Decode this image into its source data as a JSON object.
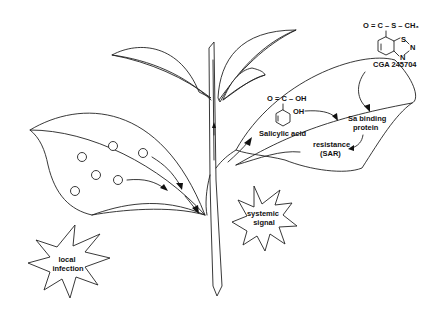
{
  "figure": {
    "labels": {
      "local_infection": [
        "local",
        "infection"
      ],
      "systemic_signal": [
        "systemic",
        "signal"
      ],
      "salicylic_acid": "Salicylic acid",
      "sa_binding_protein": [
        "Sa binding",
        "protein"
      ],
      "resistance": [
        "resistance",
        "(SAR)"
      ],
      "cga_compound": "CGA 245704"
    },
    "chemistry": {
      "salicylic_acid": {
        "carboxyl_group": "O = C – OH",
        "hydroxyl_group": "OH"
      },
      "cga_245704": {
        "thioester_group": "O = C – S – CH₃",
        "ring_atoms": [
          "S",
          "N",
          "N"
        ]
      }
    },
    "infection_spots": 7,
    "colors": {
      "line": "#222222",
      "background": "#ffffff"
    }
  }
}
